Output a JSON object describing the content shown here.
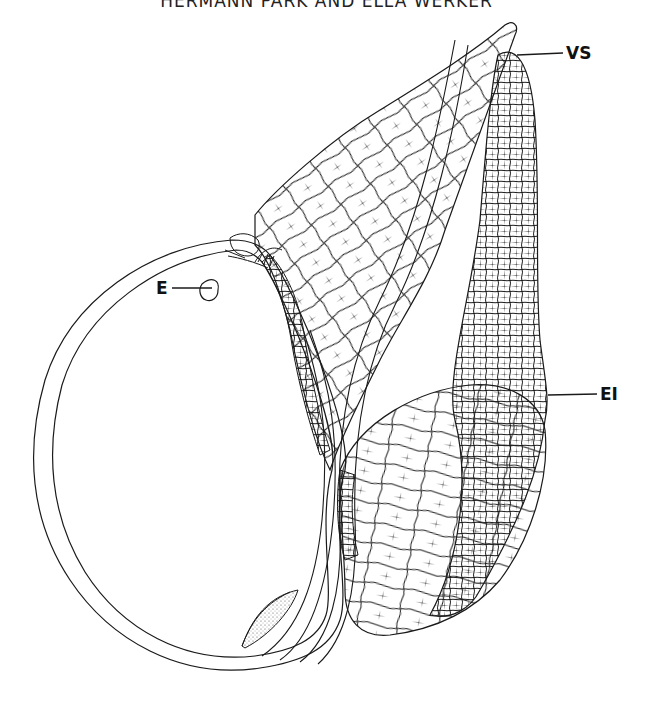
{
  "header": {
    "running_title": "HERMANN PARK AND ELLA WERKER"
  },
  "figure": {
    "labels": [
      {
        "id": "E",
        "text": "E",
        "meaning_region": "small body inside seed cavity"
      },
      {
        "id": "VS",
        "text": "VS",
        "meaning_region": "apex of slit between tissues"
      },
      {
        "id": "EI",
        "text": "EI",
        "meaning_region": "outer cellular tissue, right side"
      }
    ],
    "colors": {
      "line": "#1a1a1a",
      "background": "#ffffff"
    }
  }
}
